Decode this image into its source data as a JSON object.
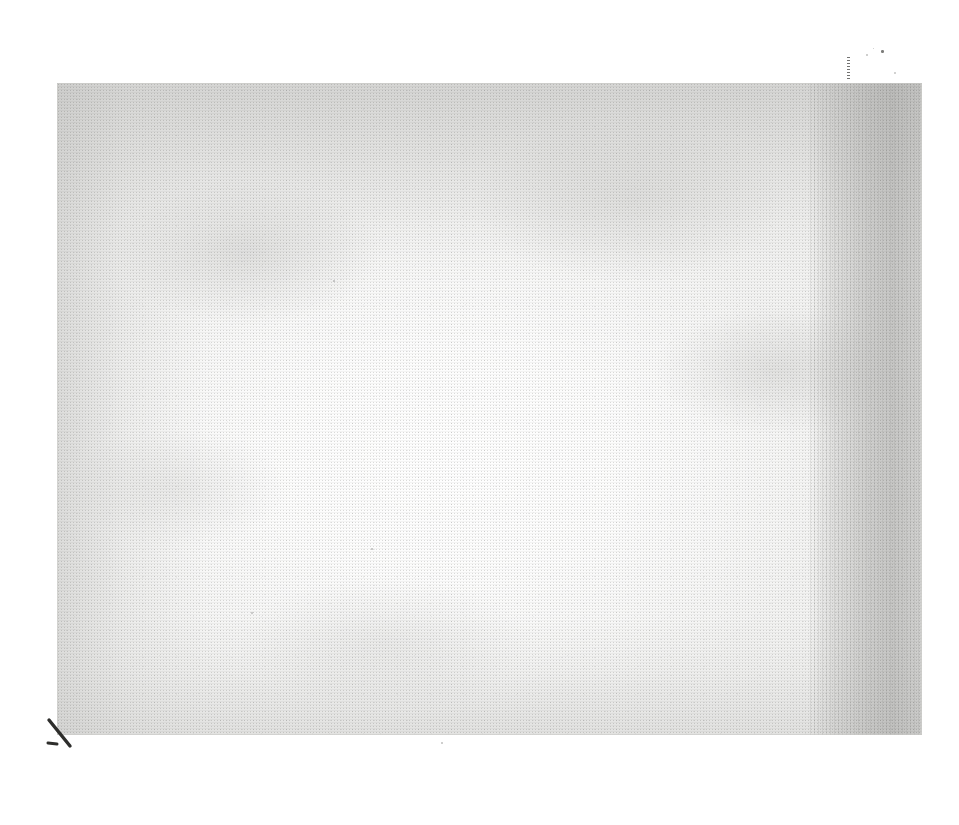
{
  "document": {
    "kind": "scanned-page",
    "content_text": "",
    "is_blank": true,
    "page_fill_color": "#f2f2f1",
    "backing_color": "#ffffff",
    "ink_color": "#3a3a38"
  },
  "page": {
    "left": 57,
    "top": 83,
    "width": 865,
    "height": 652
  },
  "artifacts": {
    "gutter_shadow": {
      "name": "right-edge gutter shadow",
      "side": "right",
      "width": 112
    },
    "vignette": {
      "name": "center-bright vignette",
      "bright_center_x_pct": 45,
      "bright_center_y_pct": 58
    },
    "corner_stroke": {
      "name": "ink stroke at lower-left corner",
      "left": 44,
      "top": 716
    },
    "top_tick": {
      "name": "dashed tick above top-right edge",
      "left": 847,
      "top": 57
    },
    "specks": [
      {
        "left": 881,
        "top": 50,
        "size": 2.5,
        "faint": false
      },
      {
        "left": 866,
        "top": 54,
        "size": 1.6,
        "faint": true
      },
      {
        "left": 873,
        "top": 48,
        "size": 1.4,
        "faint": true
      },
      {
        "left": 894,
        "top": 72,
        "size": 1.8,
        "faint": true
      },
      {
        "left": 441,
        "top": 742,
        "size": 1.6,
        "faint": true
      },
      {
        "left": 333,
        "top": 280,
        "size": 1.5,
        "faint": true
      },
      {
        "left": 490,
        "top": 290,
        "size": 1.4,
        "faint": true
      },
      {
        "left": 371,
        "top": 548,
        "size": 1.7,
        "faint": true
      },
      {
        "left": 251,
        "top": 612,
        "size": 1.5,
        "faint": true
      },
      {
        "left": 838,
        "top": 420,
        "size": 1.4,
        "faint": true
      }
    ]
  }
}
